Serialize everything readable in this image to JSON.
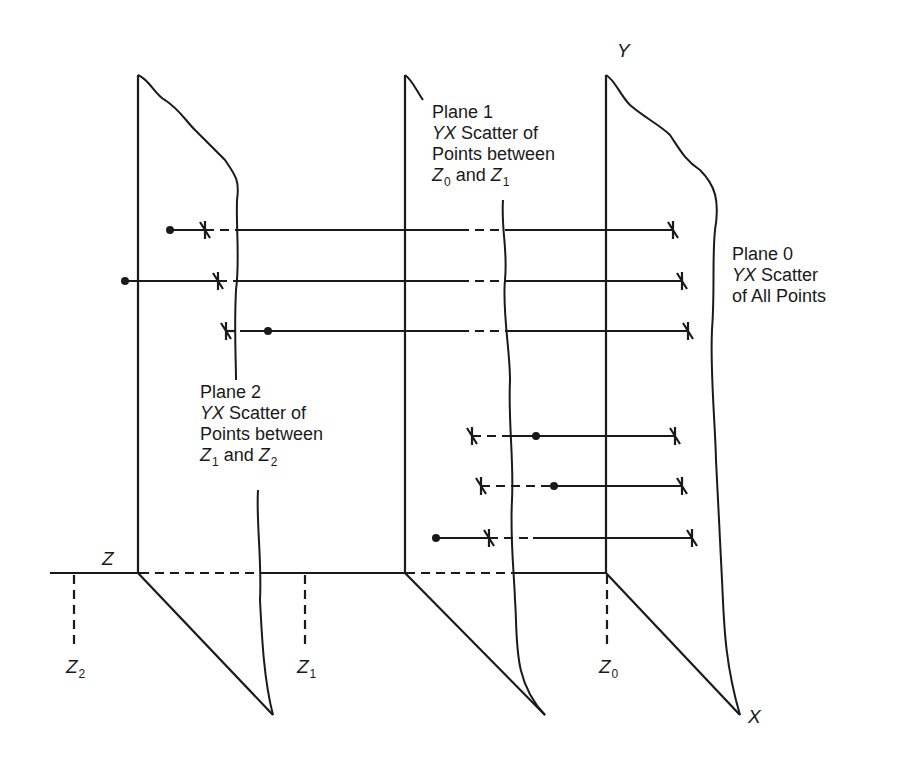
{
  "diagram": {
    "planes": [
      {
        "id": "plane0",
        "title": "Plane 0",
        "line2_italic": "YX",
        "line2_rest": " Scatter",
        "line3": "of All Points"
      },
      {
        "id": "plane1",
        "title": "Plane 1",
        "line2_italic": "YX",
        "line2_rest": " Scatter of",
        "line3": "Points between",
        "z_a": "Z",
        "z_a_sub": "0",
        "and": " and ",
        "z_b": "Z",
        "z_b_sub": "1"
      },
      {
        "id": "plane2",
        "title": "Plane 2",
        "line2_italic": "YX",
        "line2_rest": " Scatter of",
        "line3": "Points between",
        "z_a": "Z",
        "z_a_sub": "1",
        "and": " and ",
        "z_b": "Z",
        "z_b_sub": "2"
      }
    ],
    "axes": {
      "y_label": "Y",
      "x_label": "X",
      "z_label": "Z"
    },
    "z_markers": [
      {
        "label": "Z",
        "sub": "0"
      },
      {
        "label": "Z",
        "sub": "1"
      },
      {
        "label": "Z",
        "sub": "2"
      }
    ],
    "projection_rows": [
      {
        "dot_x": 170,
        "cross_x": 205,
        "end_x": 672,
        "y": 230
      },
      {
        "dot_x": 125,
        "cross_x": 218,
        "end_x": 682,
        "y": 281
      },
      {
        "dot_x": 268,
        "cross_x": 226,
        "end_x": 688,
        "y": 331
      },
      {
        "dot_x": 536,
        "cross_x": 472,
        "end_x": 675,
        "y": 436
      },
      {
        "dot_x": 554,
        "cross_x": 481,
        "end_x": 682,
        "y": 486
      },
      {
        "dot_x": 436,
        "cross_x": 489,
        "end_x": 692,
        "y": 538
      }
    ],
    "colors": {
      "ink": "#1a1a1a",
      "background": "#ffffff"
    }
  }
}
